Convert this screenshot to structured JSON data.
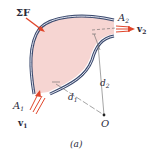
{
  "figure": {
    "caption": "(a)",
    "labels": {
      "sum_force": {
        "symbol": "Σ",
        "name": "F"
      },
      "area_inlet": {
        "base": "A",
        "sub": "1"
      },
      "area_outlet": {
        "base": "A",
        "sub": "2"
      },
      "velocity_inlet": {
        "base": "v",
        "sub": "1"
      },
      "velocity_outlet": {
        "base": "v",
        "sub": "2"
      },
      "moment_arm_1": {
        "base": "d",
        "sub": "1"
      },
      "moment_arm_2": {
        "base": "d",
        "sub": "2"
      },
      "origin": "O"
    },
    "colors": {
      "fluid_fill": "#f6d5d2",
      "wall_outline": "#3c4a6e",
      "arrow": "#e0452a",
      "line": "#555555"
    }
  }
}
